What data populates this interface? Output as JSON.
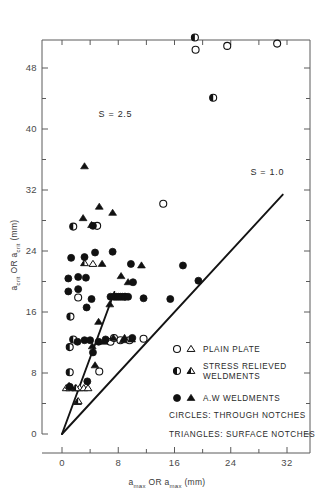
{
  "chart_data": {
    "type": "scatter",
    "title": "",
    "xlabel": "a_max OR α_max (mm)",
    "ylabel": "a_crit OR α_crit (mm)",
    "xlabel_parts": {
      "sym1": "a",
      "sub1": "max",
      "conn": "OR",
      "sym2": "a",
      "sub2": "max",
      "units": "(mm)"
    },
    "ylabel_parts": {
      "sym1": "a",
      "sub1": "crit",
      "conn": "OR",
      "sym2": "a",
      "sub2": "crit",
      "units": "(mm)"
    },
    "xlim": [
      -2.2,
      35.0
    ],
    "ylim": [
      -4.0,
      54.5
    ],
    "xticks": [
      0,
      8,
      16,
      24,
      32
    ],
    "yticks": [
      0,
      8,
      16,
      24,
      32,
      40,
      48
    ],
    "xticklabels": [
      "0",
      "8",
      "16",
      "24",
      "32"
    ],
    "yticklabels": [
      "0",
      "8",
      "16",
      "24",
      "32",
      "40",
      "48"
    ],
    "xminor_step": 4,
    "yminor_step": 4,
    "grid": false,
    "legend_position": "inside-lower-right",
    "annotations": [
      {
        "text": "S = 2.5",
        "x": 7.6,
        "y": 41.6
      },
      {
        "text": "S = 1.0",
        "x": 29.2,
        "y": 34.0
      }
    ],
    "reference_lines": [
      {
        "name": "S = 2.5",
        "slope": 2.5,
        "intercept": 0,
        "x_start": 0,
        "x_end": 7.45
      },
      {
        "name": "S = 1.0",
        "slope": 1.0,
        "intercept": 0,
        "x_start": 0,
        "x_end": 31.4
      }
    ],
    "series": [
      {
        "name": "PLAIN PLATE",
        "marker": "open-circle",
        "notch": "through",
        "points": [
          [
            5.3,
            8.2
          ],
          [
            6.9,
            12.1
          ],
          [
            7.4,
            12.6
          ],
          [
            8.3,
            12.3
          ],
          [
            9.6,
            12.3
          ],
          [
            11.6,
            12.5
          ],
          [
            14.4,
            30.2
          ],
          [
            19.0,
            50.4
          ],
          [
            23.5,
            50.9
          ],
          [
            30.6,
            51.2
          ],
          [
            5.0,
            27.3
          ],
          [
            2.3,
            17.9
          ]
        ]
      },
      {
        "name": "PLAIN PLATE",
        "marker": "open-triangle",
        "notch": "surface",
        "points": [
          [
            0.6,
            6.0
          ],
          [
            1.1,
            6.0
          ],
          [
            1.9,
            6.0
          ],
          [
            2.5,
            6.0
          ],
          [
            3.1,
            6.0
          ],
          [
            3.7,
            6.0
          ],
          [
            2.2,
            4.2
          ],
          [
            4.4,
            22.3
          ]
        ]
      },
      {
        "name": "STRESS RELIEVED WELDMENTS",
        "marker": "half-circle",
        "notch": "through",
        "points": [
          [
            1.1,
            8.1
          ],
          [
            1.1,
            11.4
          ],
          [
            1.6,
            12.4
          ],
          [
            1.2,
            15.4
          ],
          [
            1.6,
            27.2
          ],
          [
            18.9,
            52.0
          ],
          [
            21.5,
            44.1
          ]
        ]
      },
      {
        "name": "STRESS RELIEVED WELDMENTS",
        "marker": "half-triangle",
        "notch": "surface",
        "points": [
          [
            2.3,
            4.3
          ],
          [
            2.0,
            6.0
          ],
          [
            3.2,
            22.4
          ]
        ]
      },
      {
        "name": "A.W WELDMENTS",
        "marker": "filled-circle",
        "notch": "through",
        "points": [
          [
            0.9,
            20.4
          ],
          [
            0.9,
            18.7
          ],
          [
            1.3,
            23.1
          ],
          [
            2.3,
            20.6
          ],
          [
            2.3,
            19.0
          ],
          [
            3.2,
            23.2
          ],
          [
            3.4,
            20.5
          ],
          [
            3.5,
            16.6
          ],
          [
            4.2,
            17.7
          ],
          [
            4.7,
            23.8
          ],
          [
            2.2,
            12.1
          ],
          [
            3.2,
            12.3
          ],
          [
            4.0,
            12.3
          ],
          [
            4.4,
            10.7
          ],
          [
            3.6,
            6.9
          ],
          [
            4.4,
            27.3
          ],
          [
            5.2,
            12.1
          ],
          [
            6.2,
            12.4
          ],
          [
            6.9,
            18.0
          ],
          [
            7.4,
            18.0
          ],
          [
            7.7,
            18.0
          ],
          [
            8.0,
            18.0
          ],
          [
            8.3,
            18.0
          ],
          [
            8.6,
            18.0
          ],
          [
            8.9,
            18.0
          ],
          [
            9.0,
            18.0
          ],
          [
            9.4,
            18.0
          ],
          [
            9.8,
            22.3
          ],
          [
            10.1,
            19.9
          ],
          [
            10.0,
            12.6
          ],
          [
            11.6,
            17.8
          ],
          [
            15.4,
            17.7
          ],
          [
            17.2,
            22.1
          ],
          [
            19.4,
            20.1
          ],
          [
            7.2,
            23.9
          ],
          [
            1.1,
            6.2
          ]
        ]
      },
      {
        "name": "A.W WELDMENTS",
        "marker": "filled-triangle",
        "notch": "surface",
        "points": [
          [
            3.0,
            28.3
          ],
          [
            3.2,
            35.1
          ],
          [
            4.2,
            27.4
          ],
          [
            5.3,
            29.8
          ],
          [
            7.2,
            29.0
          ],
          [
            4.3,
            11.5
          ],
          [
            4.7,
            9.0
          ],
          [
            5.2,
            14.7
          ],
          [
            6.0,
            12.1
          ],
          [
            7.3,
            12.6
          ],
          [
            8.4,
            20.7
          ],
          [
            8.7,
            12.3
          ],
          [
            8.9,
            12.6
          ],
          [
            9.4,
            19.9
          ],
          [
            9.9,
            12.4
          ],
          [
            11.3,
            22.1
          ],
          [
            1.0,
            6.3
          ],
          [
            5.7,
            22.3
          ],
          [
            6.8,
            17.0
          ]
        ]
      }
    ],
    "legend": [
      {
        "id": "plain-plate",
        "circle": "open",
        "triangle": "open",
        "label_line1": "PLAIN PLATE",
        "label_line2": ""
      },
      {
        "id": "stress-relieved",
        "circle": "half",
        "triangle": "half",
        "label_line1": "STRESS RELIEVED",
        "label_line2": "WELDMENTS"
      },
      {
        "id": "aw-weldments",
        "circle": "filled",
        "triangle": "filled",
        "label_line1": "A.W WELDMENTS",
        "label_line2": ""
      }
    ],
    "legend_notes": [
      "CIRCLES: THROUGH NOTCHES",
      "TRIANGLES: SURFACE NOTCHES"
    ],
    "colors": {
      "marker": "#111111",
      "axis": "#5a5a5a",
      "text": "#2a2a2a",
      "line": "#141414",
      "background": "#ffffff"
    }
  }
}
